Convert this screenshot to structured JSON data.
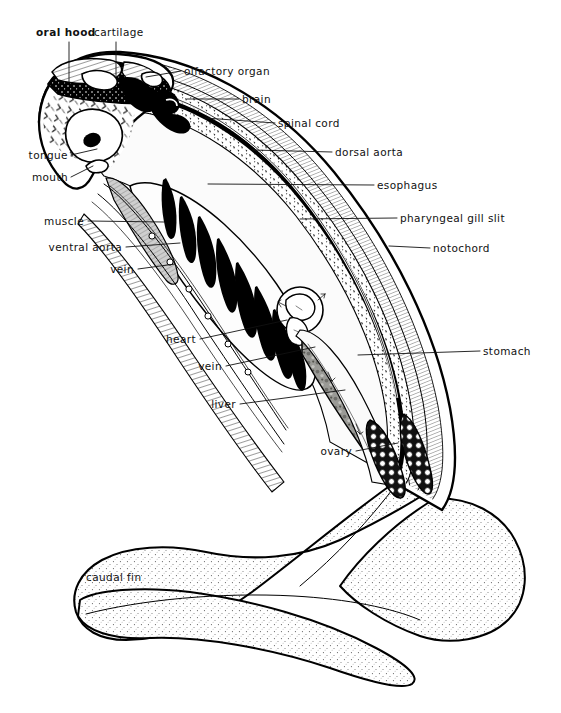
{
  "figure": {
    "background_color": "#ffffff",
    "ink_color": "#000000"
  },
  "labels": [
    {
      "id": "oral-hood",
      "text": "oral hood",
      "x": 36,
      "y": 36,
      "anchor": "start",
      "bold": true,
      "leader": "M 69,42 L 69,82"
    },
    {
      "id": "cartilage",
      "text": "cartilage",
      "x": 94,
      "y": 36,
      "anchor": "start",
      "bold": false,
      "leader": "M 116,42 L 116,76"
    },
    {
      "id": "olfactory-organ",
      "text": "olfactory organ",
      "x": 184,
      "y": 75,
      "anchor": "start",
      "bold": false,
      "leader": "M 181,71 L 146,77"
    },
    {
      "id": "brain",
      "text": "brain",
      "x": 242,
      "y": 103,
      "anchor": "start",
      "bold": false,
      "leader": "M 239,99 L 187,99"
    },
    {
      "id": "spinal-cord",
      "text": "spinal cord",
      "x": 278,
      "y": 127,
      "anchor": "start",
      "bold": false,
      "leader": "M 275,123 L 205,118"
    },
    {
      "id": "dorsal-aorta",
      "text": "dorsal aorta",
      "x": 335,
      "y": 156,
      "anchor": "start",
      "bold": false,
      "leader": "M 332,152 L 252,150"
    },
    {
      "id": "esophagus",
      "text": "esophagus",
      "x": 377,
      "y": 189,
      "anchor": "start",
      "bold": false,
      "leader": "M 374,185 L 208,184"
    },
    {
      "id": "pharyngeal-gill-slit",
      "text": "pharyngeal gill slit",
      "x": 400,
      "y": 222,
      "anchor": "start",
      "bold": false,
      "leader": "M 397,218 L 300,219"
    },
    {
      "id": "notochord",
      "text": "notochord",
      "x": 433,
      "y": 252,
      "anchor": "start",
      "bold": false,
      "leader": "M 430,248 L 389,246"
    },
    {
      "id": "stomach",
      "text": "stomach",
      "x": 483,
      "y": 355,
      "anchor": "start",
      "bold": false,
      "leader": "M 480,351 L 358,355"
    },
    {
      "id": "tongue",
      "text": "tongue",
      "x": 68,
      "y": 159,
      "anchor": "end",
      "bold": false,
      "leader": "M 71,155 L 97,149"
    },
    {
      "id": "mouth",
      "text": "mouth",
      "x": 68,
      "y": 181,
      "anchor": "end",
      "bold": false,
      "leader": "M 71,177 L 93,166"
    },
    {
      "id": "muscle",
      "text": "muscle",
      "x": 84,
      "y": 225,
      "anchor": "end",
      "bold": false,
      "leader": "M 88,221 L 164,222"
    },
    {
      "id": "ventral-aorta",
      "text": "ventral aorta",
      "x": 122,
      "y": 251,
      "anchor": "end",
      "bold": false,
      "leader": "M 126,247 L 180,243"
    },
    {
      "id": "vein-upper",
      "text": "vein",
      "x": 134,
      "y": 273,
      "anchor": "end",
      "bold": false,
      "leader": "M 138,269 L 175,264"
    },
    {
      "id": "heart",
      "text": "heart",
      "x": 196,
      "y": 343,
      "anchor": "end",
      "bold": false,
      "leader": "M 200,339 L 287,320"
    },
    {
      "id": "vein-lower",
      "text": "vein",
      "x": 222,
      "y": 370,
      "anchor": "end",
      "bold": false,
      "leader": "M 226,366 L 315,347"
    },
    {
      "id": "liver",
      "text": "liver",
      "x": 236,
      "y": 408,
      "anchor": "end",
      "bold": false,
      "leader": "M 240,404 L 345,390"
    },
    {
      "id": "ovary",
      "text": "ovary",
      "x": 352,
      "y": 455,
      "anchor": "end",
      "bold": false,
      "leader": "M 356,451 L 398,443"
    },
    {
      "id": "caudal-fin",
      "text": "caudal fin",
      "x": 86,
      "y": 581,
      "anchor": "start",
      "bold": false,
      "leader": null
    }
  ],
  "structures": {
    "gill_slit_count": 8,
    "body_layers": [
      "epidermis",
      "myotome hatching",
      "notochord",
      "spinal cord",
      "dorsal aorta"
    ],
    "shaded_regions": [
      "oral hood cirri",
      "muscle band",
      "liver",
      "ovary eggs",
      "caudal fin stipple"
    ]
  }
}
